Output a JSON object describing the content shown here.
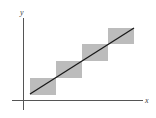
{
  "diagram": {
    "axes": {
      "x_label": "x",
      "y_label": "y",
      "axis_color": "#555555"
    },
    "boxes": [
      {
        "x": 30,
        "y": 78,
        "w": 26,
        "h": 17
      },
      {
        "x": 56,
        "y": 61,
        "w": 26,
        "h": 17
      },
      {
        "x": 82,
        "y": 44,
        "w": 26,
        "h": 17
      },
      {
        "x": 108,
        "y": 28,
        "w": 26,
        "h": 16
      }
    ],
    "box_color": "#bcbcbc",
    "line": {
      "x1": 30,
      "y1": 94,
      "x2": 134,
      "y2": 28,
      "color": "#1a1a1a"
    }
  }
}
